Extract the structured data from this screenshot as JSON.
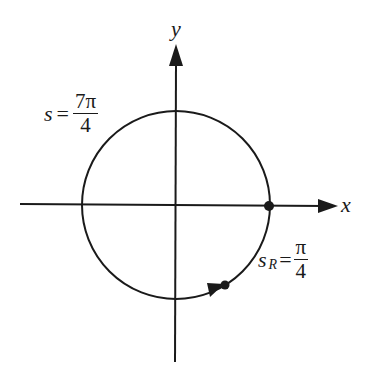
{
  "figure": {
    "type": "unit-circle-arc-diagram",
    "axes": {
      "x_label": "x",
      "y_label": "y"
    },
    "labels": {
      "arc_s": {
        "variable": "s",
        "equals": "=",
        "numerator": "7π",
        "denominator": "4"
      },
      "reference_arc": {
        "variable": "s",
        "subscript": "R",
        "equals": "=",
        "numerator": "π",
        "denominator": "4"
      }
    },
    "points": [
      {
        "name": "start-point",
        "description": "on positive x-axis"
      },
      {
        "name": "terminal-point",
        "description": "on circle in fourth quadrant at angle -π/4"
      }
    ],
    "colors": {
      "ink": "#1a1a1a",
      "background": "#ffffff"
    }
  }
}
